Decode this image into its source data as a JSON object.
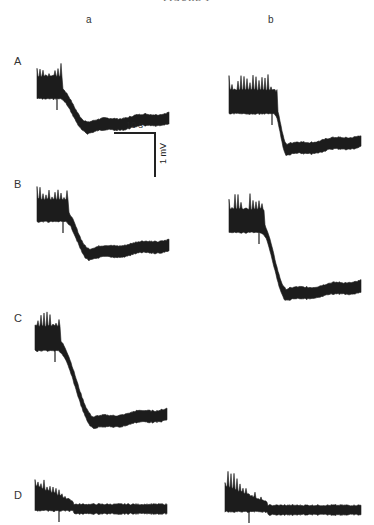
{
  "figure": {
    "title": "FIGURE 1",
    "columns": [
      {
        "label": "a",
        "x": 263
      },
      {
        "label": "b",
        "x": 270
      }
    ],
    "rows": [
      {
        "label": "A",
        "y": 60
      },
      {
        "label": "B",
        "y": 182
      },
      {
        "label": "C",
        "y": 318
      },
      {
        "label": "D",
        "y": 490
      }
    ],
    "scale_bar": {
      "time_label": "10 s",
      "voltage_label": "1 mV"
    },
    "trace_color": "#1c1c1c"
  },
  "chart_data": {
    "type": "line",
    "title": "FIGURE 1",
    "xlabel": "",
    "ylabel": "",
    "grid": false,
    "legend": null,
    "scale_bar": {
      "horizontal": "10 s",
      "vertical": "1 mV"
    },
    "columns": [
      "a",
      "b"
    ],
    "rows": [
      "A",
      "B",
      "C",
      "D"
    ],
    "panels": [
      {
        "row": "A",
        "col": "a",
        "origin": [
          37,
          35
        ],
        "width": 132,
        "baseline_high": 58,
        "baseline_low": 92,
        "drop_start_x": 22,
        "drop_end_x": 50,
        "band": 10,
        "spike_height": 25,
        "rise_end": 6,
        "shape": "sigmoid-drop"
      },
      {
        "row": "A",
        "col": "b",
        "origin": [
          229,
          38
        ],
        "width": 132,
        "baseline_high": 70,
        "baseline_low": 112,
        "drop_start_x": 45,
        "drop_end_x": 58,
        "band": 10,
        "spike_height": 28,
        "rise_end": 7,
        "shape": "sigmoid-drop"
      },
      {
        "row": "B",
        "col": "a",
        "origin": [
          37,
          158
        ],
        "width": 132,
        "baseline_high": 58,
        "baseline_low": 96,
        "drop_start_x": 28,
        "drop_end_x": 52,
        "band": 10,
        "spike_height": 25,
        "rise_end": 6,
        "shape": "sigmoid-drop"
      },
      {
        "row": "B",
        "col": "b",
        "origin": [
          229,
          172
        ],
        "width": 132,
        "baseline_high": 55,
        "baseline_low": 123,
        "drop_start_x": 32,
        "drop_end_x": 58,
        "band": 10,
        "spike_height": 28,
        "rise_end": 8,
        "shape": "sigmoid-drop"
      },
      {
        "row": "C",
        "col": "a",
        "origin": [
          35,
          293
        ],
        "width": 132,
        "baseline_high": 52,
        "baseline_low": 130,
        "drop_start_x": 22,
        "drop_end_x": 60,
        "band": 10,
        "spike_height": 30,
        "rise_end": 5,
        "shape": "sigmoid-drop"
      },
      {
        "row": "D",
        "col": "a",
        "origin": [
          35,
          454
        ],
        "width": 132,
        "baseline_high": 52,
        "baseline_low": 58,
        "drop_start_x": 20,
        "drop_end_x": 38,
        "band": 8,
        "spike_height": 36,
        "rise_end": 0,
        "shape": "burst-decay"
      },
      {
        "row": "D",
        "col": "b",
        "origin": [
          225,
          452
        ],
        "width": 136,
        "baseline_high": 55,
        "baseline_low": 61,
        "drop_start_x": 22,
        "drop_end_x": 42,
        "band": 8,
        "spike_height": 38,
        "rise_end": 0,
        "shape": "burst-decay"
      }
    ]
  }
}
